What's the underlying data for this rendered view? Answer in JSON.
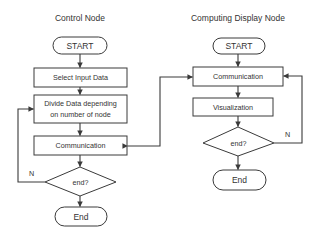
{
  "diagram": {
    "type": "flowchart",
    "columns": [
      {
        "title": "Control Node",
        "nodes": [
          {
            "id": "c_start",
            "kind": "terminator",
            "label": "START"
          },
          {
            "id": "c_select",
            "kind": "process",
            "label": "Select Input Data"
          },
          {
            "id": "c_divide",
            "kind": "process",
            "label_line1": "Divide Data depending",
            "label_line2": "on number of node"
          },
          {
            "id": "c_comm",
            "kind": "process",
            "label": "Communication"
          },
          {
            "id": "c_end_q",
            "kind": "decision",
            "label": "end?",
            "no_label": "N"
          },
          {
            "id": "c_end",
            "kind": "terminator",
            "label": "End"
          }
        ]
      },
      {
        "title": "Computing Display Node",
        "nodes": [
          {
            "id": "d_start",
            "kind": "terminator",
            "label": "START"
          },
          {
            "id": "d_comm",
            "kind": "process",
            "label": "Communication"
          },
          {
            "id": "d_vis",
            "kind": "process",
            "label": "Visualization"
          },
          {
            "id": "d_end_q",
            "kind": "decision",
            "label": "end?",
            "no_label": "N"
          },
          {
            "id": "d_end",
            "kind": "terminator",
            "label": "End"
          }
        ]
      }
    ],
    "edges": [
      {
        "from": "c_start",
        "to": "c_select"
      },
      {
        "from": "c_select",
        "to": "c_divide"
      },
      {
        "from": "c_divide",
        "to": "c_comm"
      },
      {
        "from": "c_comm",
        "to": "c_end_q"
      },
      {
        "from": "c_end_q",
        "to": "c_end"
      },
      {
        "from": "c_end_q",
        "to": "c_divide",
        "label": "N"
      },
      {
        "from": "d_start",
        "to": "d_comm"
      },
      {
        "from": "d_comm",
        "to": "d_vis"
      },
      {
        "from": "d_vis",
        "to": "d_end_q"
      },
      {
        "from": "d_end_q",
        "to": "d_end"
      },
      {
        "from": "d_end_q",
        "to": "d_comm",
        "label": "N"
      },
      {
        "from": "c_comm",
        "to": "d_comm",
        "bidirectional": true
      }
    ],
    "colors": {
      "line": "#3a3a3a",
      "text": "#333333",
      "background": "#ffffff"
    }
  }
}
